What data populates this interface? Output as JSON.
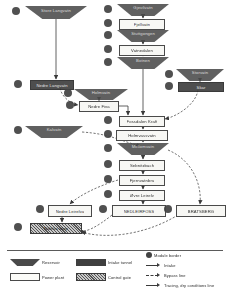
{
  "diagram": {
    "colors": {
      "reservoir": "#4a4a4a",
      "intake": "#3f3f3f",
      "plant_fill": "#f7f7f4",
      "stroke": "#3a3a3a",
      "module_border": "#434343",
      "background": "#ffffff"
    },
    "nodes": [
      {
        "id": "n01",
        "type": "reservoir",
        "label": "Store Langvatn",
        "x": 25,
        "y": 6,
        "w": 62,
        "h": 13
      },
      {
        "id": "n02",
        "type": "reservoir",
        "label": "Gjevilvatn",
        "x": 117,
        "y": 4,
        "w": 52,
        "h": 12
      },
      {
        "id": "n03",
        "type": "plant",
        "label": "Fjellvatn",
        "x": 119,
        "y": 19,
        "w": 44,
        "h": 9
      },
      {
        "id": "n04",
        "type": "reservoir",
        "label": "Stuttgongen",
        "x": 117,
        "y": 30,
        "w": 52,
        "h": 12
      },
      {
        "id": "n05",
        "type": "plant",
        "label": "Vatnedalen",
        "x": 119,
        "y": 45,
        "w": 44,
        "h": 9
      },
      {
        "id": "n06",
        "type": "reservoir",
        "label": "Botnen",
        "x": 117,
        "y": 57,
        "w": 52,
        "h": 12
      },
      {
        "id": "n07",
        "type": "intake",
        "label": "Nedre Langvatn",
        "x": 30,
        "y": 80,
        "w": 42,
        "h": 8
      },
      {
        "id": "n08",
        "type": "reservoir",
        "label": "Storvatn",
        "x": 176,
        "y": 69,
        "w": 48,
        "h": 12
      },
      {
        "id": "n09",
        "type": "intake",
        "label": "Skar",
        "x": 178,
        "y": 82,
        "w": 44,
        "h": 8
      },
      {
        "id": "n10",
        "type": "reservoir",
        "label": "Holmvatn",
        "x": 74,
        "y": 89,
        "w": 54,
        "h": 11
      },
      {
        "id": "n11",
        "type": "plant",
        "label": "Nedre Fiva",
        "x": 79,
        "y": 101,
        "w": 38,
        "h": 9
      },
      {
        "id": "n12",
        "type": "plant",
        "label": "Fossdalen Kraft",
        "x": 119,
        "y": 116,
        "w": 44,
        "h": 9
      },
      {
        "id": "n13",
        "type": "plant",
        "label": "Holmvassvatn",
        "x": 116,
        "y": 130,
        "w": 50,
        "h": 9
      },
      {
        "id": "n14",
        "type": "reservoir",
        "label": "Mellomvatn",
        "x": 117,
        "y": 143,
        "w": 52,
        "h": 12
      },
      {
        "id": "n15",
        "type": "plant",
        "label": "Sebnitzbach",
        "x": 119,
        "y": 160,
        "w": 44,
        "h": 9
      },
      {
        "id": "n16",
        "type": "plant",
        "label": "Fjernvatnbru",
        "x": 119,
        "y": 175,
        "w": 44,
        "h": 9
      },
      {
        "id": "n17",
        "type": "plant",
        "label": "Øvre Leirelv",
        "x": 119,
        "y": 190,
        "w": 44,
        "h": 9
      },
      {
        "id": "n18",
        "type": "reservoir",
        "label": "Kalvatn",
        "x": 25,
        "y": 126,
        "w": 58,
        "h": 12
      },
      {
        "id": "n19",
        "type": "plant",
        "label": "Nedre Leirelva",
        "x": 48,
        "y": 205,
        "w": 42,
        "h": 10
      },
      {
        "id": "n20",
        "type": "plant",
        "label": "NEDLEIRFOSS",
        "x": 112,
        "y": 205,
        "w": 52,
        "h": 10
      },
      {
        "id": "n21",
        "type": "plant",
        "label": "BRATSBERG",
        "x": 176,
        "y": 205,
        "w": 48,
        "h": 10
      },
      {
        "id": "n22",
        "type": "gate",
        "label": "Nidelva utløp",
        "x": 30,
        "y": 223,
        "w": 50,
        "h": 9
      }
    ],
    "module_borders": [
      {
        "id": "c01",
        "x": 12,
        "y": 7
      },
      {
        "id": "c02",
        "x": 104,
        "y": 5
      },
      {
        "id": "c03",
        "x": 104,
        "y": 19
      },
      {
        "id": "c04",
        "x": 104,
        "y": 31
      },
      {
        "id": "c05",
        "x": 104,
        "y": 45
      },
      {
        "id": "c06",
        "x": 104,
        "y": 58
      },
      {
        "id": "c07",
        "x": 14,
        "y": 80
      },
      {
        "id": "c08",
        "x": 64,
        "y": 89
      },
      {
        "id": "c09",
        "x": 66,
        "y": 101
      },
      {
        "id": "c10",
        "x": 165,
        "y": 70
      },
      {
        "id": "c11",
        "x": 165,
        "y": 82
      },
      {
        "id": "c12",
        "x": 104,
        "y": 116
      },
      {
        "id": "c13",
        "x": 104,
        "y": 130
      },
      {
        "id": "c14",
        "x": 104,
        "y": 144
      },
      {
        "id": "c15",
        "x": 104,
        "y": 160
      },
      {
        "id": "c16",
        "x": 104,
        "y": 175
      },
      {
        "id": "c17",
        "x": 104,
        "y": 190
      },
      {
        "id": "c18",
        "x": 14,
        "y": 126
      },
      {
        "id": "c19",
        "x": 36,
        "y": 205
      },
      {
        "id": "c20",
        "x": 99,
        "y": 205
      },
      {
        "id": "c21",
        "x": 164,
        "y": 205
      },
      {
        "id": "c22",
        "x": 14,
        "y": 223
      }
    ],
    "edges": [
      {
        "from": "n01",
        "to": "n07",
        "style": "solid"
      },
      {
        "from": "n02",
        "to": "n03",
        "style": "solid"
      },
      {
        "from": "n03",
        "to": "n04",
        "style": "solid"
      },
      {
        "from": "n04",
        "to": "n05",
        "style": "solid"
      },
      {
        "from": "n05",
        "to": "n06",
        "style": "solid"
      },
      {
        "from": "n06",
        "to": "n12",
        "style": "solid"
      },
      {
        "from": "n07",
        "to": "n11",
        "style": "dashed"
      },
      {
        "from": "n10",
        "to": "n11",
        "style": "solid"
      },
      {
        "from": "n11",
        "to": "n12",
        "style": "solid"
      },
      {
        "from": "n08",
        "to": "n09",
        "style": "solid"
      },
      {
        "from": "n09",
        "to": "n12",
        "style": "dashed"
      },
      {
        "from": "n12",
        "to": "n13",
        "style": "solid"
      },
      {
        "from": "n13",
        "to": "n14",
        "style": "solid"
      },
      {
        "from": "n14",
        "to": "n15",
        "style": "solid"
      },
      {
        "from": "n15",
        "to": "n16",
        "style": "solid"
      },
      {
        "from": "n16",
        "to": "n17",
        "style": "solid"
      },
      {
        "from": "n17",
        "to": "n20",
        "style": "solid"
      },
      {
        "from": "n18",
        "to": "n14",
        "style": "dashed"
      },
      {
        "from": "n14",
        "to": "n21",
        "style": "dashed"
      },
      {
        "from": "n16",
        "to": "n19",
        "style": "dashed"
      },
      {
        "from": "n19",
        "to": "n22",
        "style": "solid"
      },
      {
        "from": "n20",
        "to": "n22",
        "style": "dashed"
      },
      {
        "from": "n21",
        "to": "n22",
        "style": "dashed"
      }
    ]
  },
  "legend": {
    "items": [
      {
        "id": "lg-reservoir",
        "symbol": "reservoir-trapezoid",
        "label": "Reservoir"
      },
      {
        "id": "lg-intake",
        "symbol": "intake-rectangle",
        "label": "Intake tunnel"
      },
      {
        "id": "lg-plant",
        "symbol": "powerplant-box",
        "label": "Power plant"
      },
      {
        "id": "lg-gate",
        "symbol": "control-gate-hatch",
        "label": "Control gate"
      },
      {
        "id": "lg-module",
        "symbol": "module-border-circle",
        "label": "Module border"
      },
      {
        "id": "lg-intakeline",
        "symbol": "arrow-solid",
        "label": "Intake"
      },
      {
        "id": "lg-bypass",
        "symbol": "arrow-dashed",
        "label": "Bypass line"
      },
      {
        "id": "lg-tracing",
        "symbol": "arrow-thick",
        "label": "Tracing, dry conditions line"
      }
    ]
  }
}
